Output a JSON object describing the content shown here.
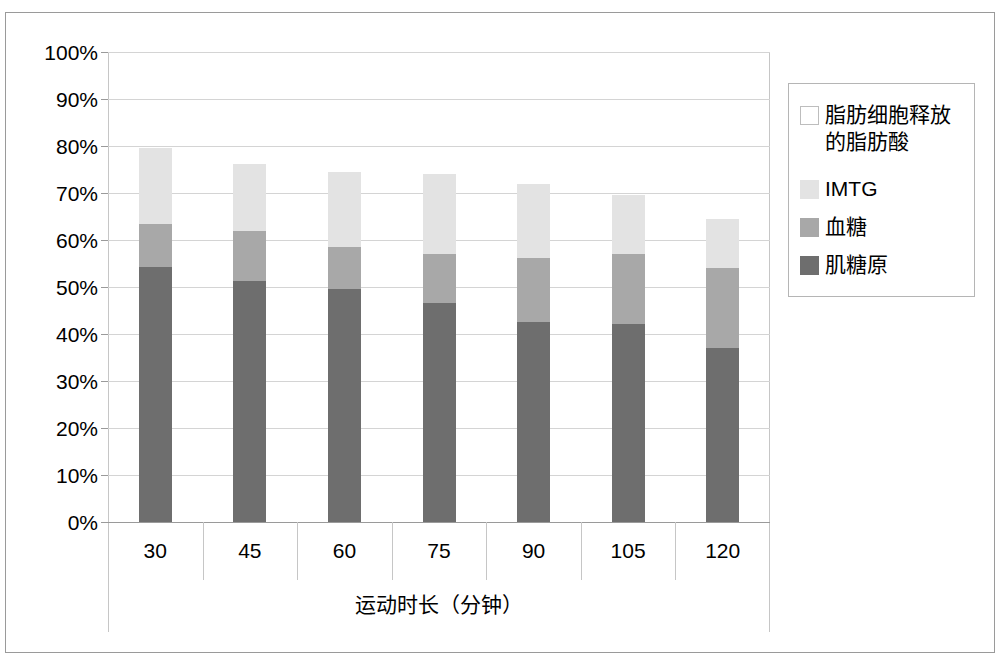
{
  "chart_data": {
    "type": "bar",
    "stacked": true,
    "title": "",
    "xlabel": "运动时长（分钟）",
    "ylabel": "",
    "categories": [
      "30",
      "45",
      "60",
      "75",
      "90",
      "105",
      "120"
    ],
    "ylim": [
      0,
      100
    ],
    "ytick_labels": [
      "0%",
      "10%",
      "20%",
      "30%",
      "40%",
      "50%",
      "60%",
      "70%",
      "80%",
      "90%",
      "100%"
    ],
    "ytick_values": [
      0,
      10,
      20,
      30,
      40,
      50,
      60,
      70,
      80,
      90,
      100
    ],
    "grid": true,
    "legend_position": "right",
    "series": [
      {
        "name": "肌糖原",
        "color": "#6e6e6e",
        "values": [
          54.3,
          51.3,
          49.5,
          46.6,
          42.5,
          42.1,
          37.0
        ]
      },
      {
        "name": "血糖",
        "color": "#a8a8a8",
        "values": [
          9.2,
          10.6,
          9.1,
          10.4,
          13.6,
          14.9,
          17.0
        ]
      },
      {
        "name": "IMTG",
        "color": "#e3e3e3",
        "values": [
          16.0,
          14.3,
          15.9,
          17.0,
          15.9,
          12.5,
          10.5
        ]
      },
      {
        "name": "脂肪细胞释放的脂肪酸",
        "color": "#ffffff",
        "values": [
          20.5,
          23.8,
          25.5,
          26.0,
          28.0,
          30.5,
          35.5
        ]
      }
    ],
    "cumulative_tops": {
      "肌糖原": [
        54.3,
        51.3,
        49.5,
        46.6,
        42.5,
        42.1,
        37.0
      ],
      "血糖": [
        63.5,
        61.9,
        58.6,
        57.0,
        56.1,
        57.0,
        54.0
      ],
      "IMTG": [
        79.5,
        76.2,
        74.5,
        74.0,
        72.0,
        69.5,
        64.5
      ]
    }
  },
  "legend": {
    "items": [
      {
        "label": "脂肪细胞释放\n的脂肪酸",
        "color": "#ffffff"
      },
      {
        "label": "IMTG",
        "color": "#e3e3e3"
      },
      {
        "label": "血糖",
        "color": "#a8a8a8"
      },
      {
        "label": "肌糖原",
        "color": "#6e6e6e"
      }
    ]
  },
  "colors": {
    "frame_border": "#9a9a9a",
    "gridline": "#d4d4d4",
    "plot_border": "#c6c6c6",
    "legend_border": "#b5b5b5",
    "text": "#000000",
    "background": "#ffffff"
  }
}
